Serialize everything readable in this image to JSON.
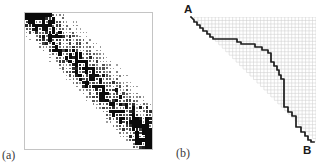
{
  "figure": {
    "panel_a": {
      "label": "(a)",
      "matrix": {
        "cells": 38,
        "sigma_right": 7,
        "sigma_left": 3.2,
        "seed": 20240603,
        "threshold": 0.17,
        "dot_color": "#0a0a0a",
        "border_color": "#c4c4c4"
      }
    },
    "panel_b": {
      "label": "(b)",
      "start_label": "A",
      "end_label": "B",
      "grid": {
        "cells": 36,
        "line_color": "#cfcfcf",
        "apex": [
          29,
          17
        ],
        "top_right": [
          154,
          17
        ],
        "bottom_right": [
          154,
          142
        ]
      },
      "path": {
        "color": "#1c1c1c",
        "width": 1.7,
        "points": [
          [
            0,
            0
          ],
          [
            3,
            3
          ],
          [
            3,
            5
          ],
          [
            6,
            5
          ],
          [
            6,
            8
          ],
          [
            9,
            8
          ],
          [
            9,
            11
          ],
          [
            12,
            11
          ],
          [
            12,
            14
          ],
          [
            16,
            14
          ],
          [
            16,
            17
          ],
          [
            19,
            17
          ],
          [
            19,
            20
          ],
          [
            22,
            20
          ],
          [
            22,
            22
          ],
          [
            46,
            22
          ],
          [
            46,
            25
          ],
          [
            50,
            25
          ],
          [
            50,
            27
          ],
          [
            64,
            27
          ],
          [
            64,
            30
          ],
          [
            71,
            30
          ],
          [
            71,
            33
          ],
          [
            77,
            33
          ],
          [
            77,
            36
          ],
          [
            80,
            36
          ],
          [
            80,
            45
          ],
          [
            83,
            45
          ],
          [
            83,
            49
          ],
          [
            86,
            49
          ],
          [
            86,
            53
          ],
          [
            88,
            53
          ],
          [
            88,
            58
          ],
          [
            90,
            58
          ],
          [
            90,
            62
          ],
          [
            93,
            62
          ],
          [
            93,
            90
          ],
          [
            97,
            90
          ],
          [
            97,
            95
          ],
          [
            101,
            95
          ],
          [
            101,
            99
          ],
          [
            105,
            99
          ],
          [
            105,
            110
          ],
          [
            110,
            110
          ],
          [
            110,
            115
          ],
          [
            114,
            115
          ],
          [
            114,
            119
          ],
          [
            117,
            119
          ],
          [
            117,
            123
          ],
          [
            120,
            123
          ],
          [
            120,
            125
          ],
          [
            123,
            125
          ]
        ]
      }
    }
  }
}
